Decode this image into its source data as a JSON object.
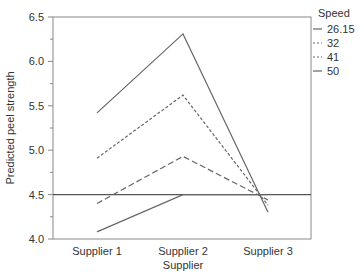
{
  "chart_data": {
    "type": "line",
    "title": "",
    "xlabel": "Supplier",
    "ylabel": "Predicted peel strength",
    "categories": [
      "Supplier 1",
      "Supplier 2",
      "Supplier 3"
    ],
    "ylim": [
      4.0,
      6.5
    ],
    "yticks": [
      "4.0",
      "4.5",
      "5.0",
      "5.5",
      "6.0",
      "6.5"
    ],
    "grid": false,
    "reference_line": 4.5,
    "legend": {
      "title": "Speed",
      "position": "right"
    },
    "series": [
      {
        "name": "26.15",
        "style": "solid",
        "values": [
          5.42,
          6.31,
          4.3
        ]
      },
      {
        "name": "32",
        "style": "short-dash",
        "values": [
          4.91,
          5.62,
          4.38
        ]
      },
      {
        "name": "41",
        "style": "long-dash",
        "values": [
          4.4,
          4.93,
          4.44
        ]
      },
      {
        "name": "50",
        "style": "solid",
        "values": [
          4.08,
          4.5,
          4.5
        ]
      }
    ]
  }
}
